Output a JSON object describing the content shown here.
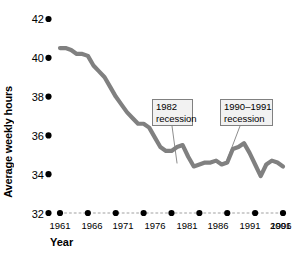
{
  "chart_data": {
    "type": "line",
    "title": "",
    "xlabel": "Year",
    "ylabel": "Average weekly hours",
    "xlim": [
      1961,
      2001
    ],
    "ylim": [
      32,
      42
    ],
    "grid": false,
    "legend": "none",
    "y_ticks": [
      42,
      40,
      38,
      36,
      34,
      32
    ],
    "x_ticks": [
      1961,
      1966,
      1971,
      1976,
      1981,
      1986,
      1991,
      1996,
      2001
    ],
    "series": [
      {
        "name": "Average weekly hours",
        "color": "#808080",
        "x": [
          1961,
          1962,
          1963,
          1964,
          1965,
          1966,
          1967,
          1968,
          1969,
          1970,
          1971,
          1972,
          1973,
          1974,
          1975,
          1976,
          1977,
          1978,
          1979,
          1980,
          1981,
          1982,
          1983,
          1984,
          1985,
          1986,
          1987,
          1988,
          1989,
          1990,
          1991,
          1992,
          1993,
          1994,
          1995,
          1996,
          1997,
          1998,
          1999,
          2000,
          2001
        ],
        "values": [
          40.5,
          40.5,
          40.4,
          40.2,
          40.2,
          40.1,
          39.6,
          39.3,
          39.0,
          38.5,
          38.0,
          37.6,
          37.2,
          36.9,
          36.6,
          36.6,
          36.4,
          35.9,
          35.4,
          35.2,
          35.2,
          35.4,
          35.5,
          34.9,
          34.4,
          34.5,
          34.6,
          34.6,
          34.7,
          34.5,
          34.6,
          35.3,
          35.4,
          35.6,
          35.1,
          34.5,
          33.9,
          34.5,
          34.7,
          34.6,
          34.4
        ]
      }
    ],
    "annotations": [
      {
        "id": "recession-1982",
        "line1": "1982",
        "line2": "recession",
        "target_x": 1982,
        "target_y": 34.4
      },
      {
        "id": "recession-1990-1991",
        "line1": "1990–1991",
        "line2": "recession",
        "target_x": 1991,
        "target_y": 34.6
      }
    ]
  },
  "axis": {
    "ylabel": "Average weekly hours",
    "xlabel": "Year",
    "y_ticks": [
      "42",
      "40",
      "38",
      "36",
      "34",
      "32"
    ],
    "x_ticks": [
      "1961",
      "1966",
      "1971",
      "1976",
      "1981",
      "1986",
      "1991",
      "1996",
      "2001"
    ]
  },
  "annotations": {
    "a1_line1": "1982",
    "a1_line2": "recession",
    "a2_line1": "1990–1991",
    "a2_line2": "recession"
  },
  "colors": {
    "line": "#808080",
    "marker": "#000000",
    "baseline_dots": "#c8c8c8",
    "annotation_box_fill": "#f2f2f2",
    "annotation_box_border": "#808080",
    "leader": "#808080"
  }
}
